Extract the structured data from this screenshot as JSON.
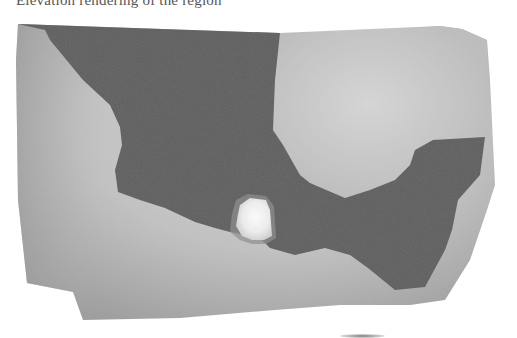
{
  "caption": {
    "text": "Elevation rendering of the region"
  },
  "map": {
    "type": "grayscale relief map",
    "regions": [
      {
        "name": "surrounding-terrain",
        "shade": "light gray gradient",
        "color": "#b9b9b9"
      },
      {
        "name": "land-mass",
        "shade": "dark gray",
        "color": "#5f5f5f"
      },
      {
        "name": "highlight-peak",
        "shade": "near white",
        "color": "#f4f4f4"
      }
    ],
    "colors": {
      "light_terrain": "#c4c4c4",
      "light_terrain_dark": "#9d9d9d",
      "land": "#5f5f5f",
      "peak": "#f6f6f6",
      "peak_halo": "#d8d8d8"
    }
  }
}
